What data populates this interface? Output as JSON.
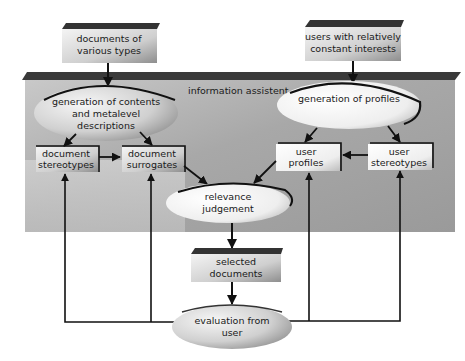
{
  "diagram": {
    "panel": {
      "title": "information assistent"
    },
    "inputs": {
      "documents": {
        "line1": "documents of",
        "line2": "various types"
      },
      "users": {
        "line1": "users with relatively",
        "line2": "constant interests"
      }
    },
    "processes": {
      "generation_contents": {
        "line1": "generation of contents",
        "line2": "and metalevel",
        "line3": "descriptions"
      },
      "generation_profiles": {
        "line1": "generation of profiles"
      },
      "relevance": {
        "line1": "relevance",
        "line2": "judgement"
      },
      "evaluation": {
        "line1": "evaluation from",
        "line2": "user"
      }
    },
    "stores": {
      "document_stereotypes": {
        "line1": "document",
        "line2": "stereotypes"
      },
      "document_surrogates": {
        "line1": "document",
        "line2": "surrogates"
      },
      "user_profiles": {
        "line1": "user",
        "line2": "profiles"
      },
      "user_stereotypes": {
        "line1": "user",
        "line2": "stereotypes"
      },
      "selected_documents": {
        "line1": "selected",
        "line2": "documents"
      }
    },
    "colors": {
      "line": "#111111",
      "panel": "#bdbdbd",
      "strip": "#3a3a3a",
      "ellipse": "#d8d8d8"
    }
  }
}
